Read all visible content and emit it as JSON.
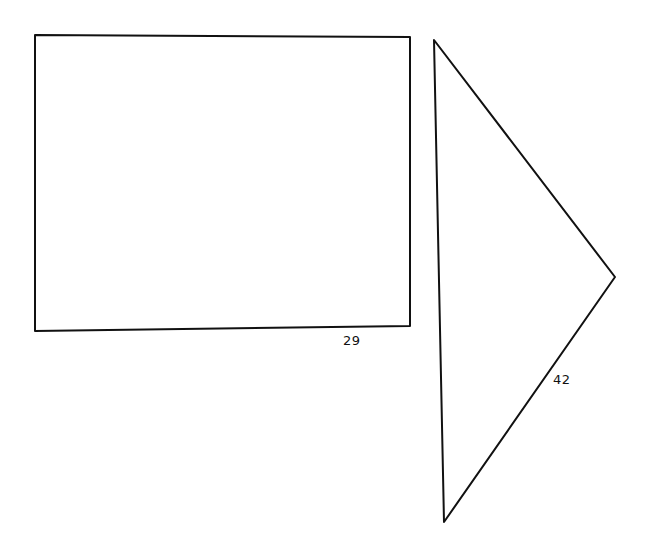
{
  "diagram": {
    "background": "#ffffff",
    "stroke_color": "#111111",
    "shapes": [
      {
        "id": "rectangle",
        "type": "rectangle",
        "points": "35,35 410,37 410,326 35,331",
        "label": {
          "text": "29",
          "x": 343,
          "y": 334
        }
      },
      {
        "id": "triangle",
        "type": "triangle",
        "points": "434,40 615,277 444,522",
        "label": {
          "text": "42",
          "x": 553,
          "y": 373
        }
      }
    ]
  }
}
